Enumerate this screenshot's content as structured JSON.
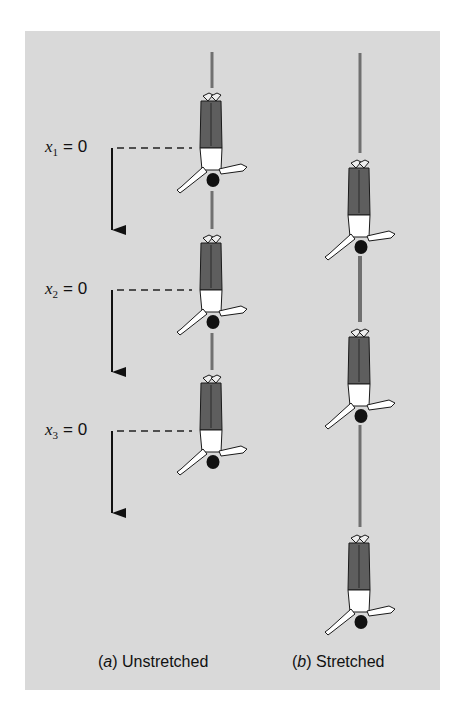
{
  "figure": {
    "background_color": "#d9d9d9",
    "cord_color": "#707070",
    "arrow_color": "#111111",
    "jumper_colors": {
      "legs": "#5e5e5e",
      "torso": "#ffffff",
      "head": "#111111",
      "outline": "#1a1a1a"
    },
    "labels": [
      {
        "var": "x",
        "sub": "1",
        "eq": "= 0"
      },
      {
        "var": "x",
        "sub": "2",
        "eq": "= 0"
      },
      {
        "var": "x",
        "sub": "3",
        "eq": "= 0"
      }
    ],
    "captions": [
      {
        "letter": "a",
        "text": "Unstretched"
      },
      {
        "letter": "b",
        "text": "Stretched"
      }
    ],
    "columns": [
      {
        "name": "unstretched",
        "jumper_count": 3
      },
      {
        "name": "stretched",
        "jumper_count": 3
      }
    ]
  }
}
